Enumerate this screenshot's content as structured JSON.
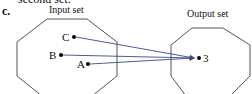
{
  "header": {
    "cutoff_text": "second set.",
    "part_label": "c."
  },
  "input_set": {
    "title": "Input set",
    "elements": [
      {
        "label": "C",
        "x": 74,
        "y": 37
      },
      {
        "label": "B",
        "x": 61,
        "y": 55
      },
      {
        "label": "A",
        "x": 88,
        "y": 64
      }
    ]
  },
  "output_set": {
    "title": "Output set",
    "elements": [
      {
        "label": "3",
        "x": 199,
        "y": 58
      }
    ]
  },
  "mappings": [
    {
      "from": "C",
      "to": "3"
    },
    {
      "from": "B",
      "to": "3"
    },
    {
      "from": "A",
      "to": "3"
    }
  ],
  "colors": {
    "arrow": "#3a4a8a",
    "outline": "#555555",
    "dot": "#000000"
  }
}
